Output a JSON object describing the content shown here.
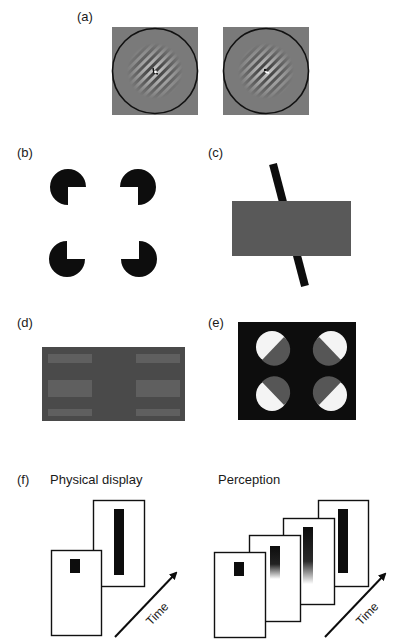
{
  "panels": {
    "a": {
      "label": "(a)",
      "description": "Two Gabor-like grating patches inside black circles on gray squares"
    },
    "b": {
      "label": "(b)",
      "description": "Kanizsa illusory square formed by four pac-man inducers"
    },
    "c": {
      "label": "(c)",
      "description": "Gray rectangle occluding a black oblique bar"
    },
    "d": {
      "label": "(d)",
      "description": "Dark rectangle with faint lighter horizontal bands on left and right"
    },
    "e": {
      "label": "(e)",
      "description": "Black rectangle with four white discs partially covered by gray"
    },
    "f": {
      "label": "(f)",
      "physical_title": "Physical display",
      "perception_title": "Perception",
      "time_label": "Time"
    }
  },
  "colors": {
    "background": "#ffffff",
    "gray_patch": "#7a7a7a",
    "occluder": "#595959",
    "panel_d_bg": "#4a4a4a",
    "panel_d_band": "#5f5f5f",
    "black": "#0d0d0d",
    "disc_gray": "#565656"
  }
}
